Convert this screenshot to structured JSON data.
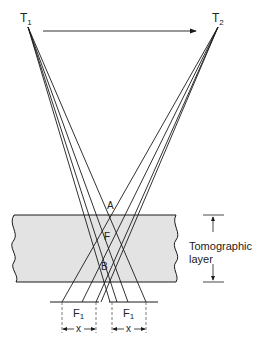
{
  "diagram": {
    "labels": {
      "t1": "T",
      "t1_sub": "1",
      "t2": "T",
      "t2_sub": "2",
      "point_a": "A",
      "point_f": "F",
      "point_b": "B",
      "film_left": "F",
      "film_left_sub": "1",
      "film_right": "F",
      "film_right_sub": "1",
      "dim_left": "x",
      "dim_right": "x",
      "layer_label_line1": "Tomographic",
      "layer_label_line2": "layer"
    },
    "colors": {
      "line": "#1a1a1a",
      "slab_fill": "#e3e3e3",
      "dashed": "#555555"
    }
  }
}
